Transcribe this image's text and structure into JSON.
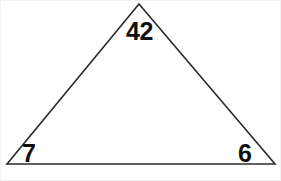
{
  "figure": {
    "type": "triangle-diagram",
    "background_color": "#ffffff",
    "stroke_color": "#2b2b2b",
    "label_color": "#101010",
    "frame_color": "#f2f2f2",
    "canvas": {
      "width": 281,
      "height": 181
    },
    "vertices": {
      "apex": {
        "x": 138,
        "y": 3
      },
      "bottom_left": {
        "x": 6,
        "y": 163
      },
      "bottom_right": {
        "x": 274,
        "y": 163
      }
    },
    "labels": {
      "apex": "42",
      "bottom_left": "7",
      "bottom_right": "6"
    }
  }
}
